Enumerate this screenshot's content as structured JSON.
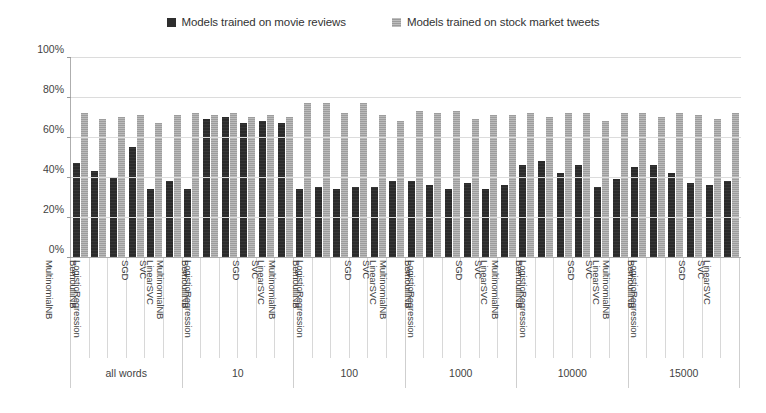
{
  "chart_data": {
    "type": "bar",
    "title": "",
    "subtitle": "",
    "xlabel": "",
    "ylabel": "",
    "ylim": [
      0,
      100
    ],
    "y_ticks": [
      "0%",
      "20%",
      "40%",
      "60%",
      "80%",
      "100%"
    ],
    "y_tick_values": [
      0,
      20,
      40,
      60,
      80,
      100
    ],
    "grid": true,
    "legend_position": "top-center",
    "legend": [
      {
        "name": "Models trained on movie reviews",
        "color": "#2b2b2b",
        "marker": "dark-square-marker"
      },
      {
        "name": "Models trained on stock market tweets",
        "color": "#9d9d9d",
        "marker": "gray-square-marker"
      }
    ],
    "categories": [
      "MultinomialNB",
      "BernoulliNB",
      "LogisticRegression",
      "SGD",
      "SVC",
      "LinearSVC"
    ],
    "groups": [
      {
        "label": "all words",
        "series": [
          {
            "name": "Models trained on movie reviews",
            "values": [
              47,
              43,
              40,
              55,
              34,
              38
            ]
          },
          {
            "name": "Models trained on stock market tweets",
            "values": [
              72,
              69,
              70,
              71,
              67,
              71
            ]
          }
        ]
      },
      {
        "label": "10",
        "series": [
          {
            "name": "Models trained on movie reviews",
            "values": [
              34,
              69,
              70,
              67,
              68,
              67
            ]
          },
          {
            "name": "Models trained on stock market tweets",
            "values": [
              72,
              71,
              72,
              70,
              71,
              70
            ]
          }
        ]
      },
      {
        "label": "100",
        "series": [
          {
            "name": "Models trained on movie reviews",
            "values": [
              34,
              35,
              34,
              35,
              35,
              38
            ]
          },
          {
            "name": "Models trained on stock market tweets",
            "values": [
              77,
              77,
              72,
              77,
              71,
              68
            ]
          }
        ]
      },
      {
        "label": "1000",
        "series": [
          {
            "name": "Models trained on movie reviews",
            "values": [
              38,
              36,
              34,
              37,
              34,
              36
            ]
          },
          {
            "name": "Models trained on stock market tweets",
            "values": [
              73,
              72,
              73,
              69,
              71,
              71
            ]
          }
        ]
      },
      {
        "label": "10000",
        "series": [
          {
            "name": "Models trained on movie reviews",
            "values": [
              46,
              48,
              42,
              46,
              35,
              39
            ]
          },
          {
            "name": "Models trained on stock market tweets",
            "values": [
              72,
              70,
              72,
              72,
              68,
              72
            ]
          }
        ]
      },
      {
        "label": "15000",
        "series": [
          {
            "name": "Models trained on movie reviews",
            "values": [
              45,
              46,
              42,
              37,
              36,
              38
            ]
          },
          {
            "name": "Models trained on stock market tweets",
            "values": [
              72,
              70,
              72,
              71,
              69,
              72
            ]
          }
        ]
      }
    ]
  },
  "colors": {
    "series_dark": "#2b2b2b",
    "series_gray": "#9d9d9d",
    "gridline": "#dcdcdc",
    "axis": "#aeaeae",
    "text": "#3f3f3f",
    "background": "#ffffff"
  }
}
